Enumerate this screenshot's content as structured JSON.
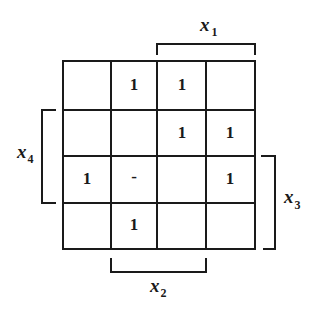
{
  "kmap": {
    "rows": 4,
    "cols": 4,
    "cells": [
      [
        "",
        "1",
        "1",
        ""
      ],
      [
        "",
        "",
        "1",
        "1"
      ],
      [
        "1",
        "-",
        "",
        "1"
      ],
      [
        "",
        "1",
        "",
        ""
      ]
    ]
  },
  "labels": {
    "x1": {
      "base": "x",
      "sub": "1"
    },
    "x2": {
      "base": "x",
      "sub": "2"
    },
    "x3": {
      "base": "x",
      "sub": "3"
    },
    "x4": {
      "base": "x",
      "sub": "4"
    }
  }
}
